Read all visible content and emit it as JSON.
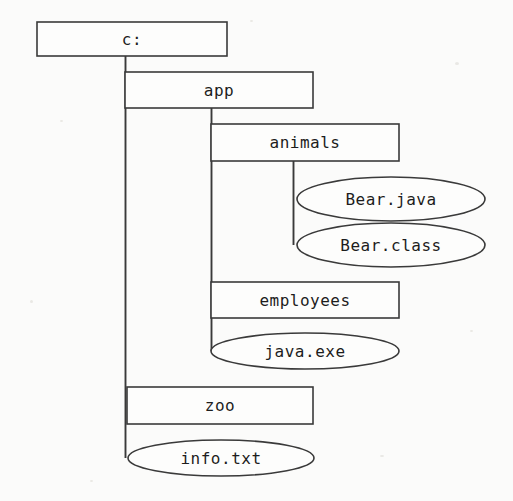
{
  "diagram": {
    "background_color": "#fbfbfa",
    "stroke_color": "#3a3a3a",
    "text_color": "#1d1d1d",
    "nodes": [
      {
        "id": "root",
        "label": "c:",
        "shape": "rectangle",
        "kind": "directory",
        "depth": 0,
        "x": 37,
        "y": 22,
        "width": 190,
        "height": 34,
        "cx": 132,
        "cy": 39
      },
      {
        "id": "app",
        "label": "app",
        "shape": "rectangle",
        "kind": "directory",
        "depth": 1,
        "x": 125,
        "y": 72,
        "width": 188,
        "height": 36,
        "cx": 219,
        "cy": 90
      },
      {
        "id": "animals",
        "label": "animals",
        "shape": "rectangle",
        "kind": "directory",
        "depth": 2,
        "x": 211,
        "y": 124,
        "width": 188,
        "height": 37,
        "cx": 305,
        "cy": 142
      },
      {
        "id": "bear-java",
        "label": "Bear.java",
        "shape": "ellipse",
        "kind": "file",
        "depth": 3,
        "cx": 391,
        "cy": 199,
        "rx": 94,
        "ry": 22
      },
      {
        "id": "bear-class",
        "label": "Bear.class",
        "shape": "ellipse",
        "kind": "file",
        "depth": 3,
        "cx": 391,
        "cy": 245,
        "rx": 94,
        "ry": 22
      },
      {
        "id": "employees",
        "label": "employees",
        "shape": "rectangle",
        "kind": "directory",
        "depth": 2,
        "x": 211,
        "y": 282,
        "width": 188,
        "height": 36,
        "cx": 305,
        "cy": 300
      },
      {
        "id": "java-exe",
        "label": "java.exe",
        "shape": "ellipse",
        "kind": "file",
        "depth": 2,
        "cx": 305,
        "cy": 351,
        "rx": 94,
        "ry": 18
      },
      {
        "id": "zoo",
        "label": "zoo",
        "shape": "rectangle",
        "kind": "directory",
        "depth": 1,
        "x": 127,
        "y": 387,
        "width": 186,
        "height": 37,
        "cx": 220,
        "cy": 406
      },
      {
        "id": "info-txt",
        "label": "info.txt",
        "shape": "ellipse",
        "kind": "file",
        "depth": 1,
        "cx": 221,
        "cy": 458,
        "rx": 93,
        "ry": 18
      }
    ],
    "connectors": [
      {
        "id": "root-trunk",
        "from": "root",
        "type": "vertical",
        "x": 125.5,
        "y1": 56,
        "y2": 458
      },
      {
        "id": "root-to-app",
        "from": "root",
        "type": "horizontal",
        "y": 72,
        "x1": 125,
        "x2": 127
      },
      {
        "id": "app-trunk",
        "from": "app",
        "type": "vertical",
        "x": 211.5,
        "y1": 108,
        "y2": 351
      },
      {
        "id": "app-to-animals",
        "from": "app",
        "type": "horizontal",
        "y": 124,
        "x1": 211,
        "x2": 213
      },
      {
        "id": "animals-trunk",
        "from": "animals",
        "type": "vertical",
        "x": 293.5,
        "y1": 161,
        "y2": 245
      }
    ]
  }
}
